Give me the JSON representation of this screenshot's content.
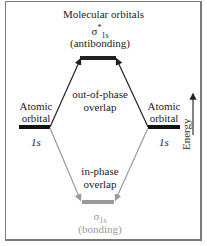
{
  "title": "Molecular orbitals",
  "antibonding": {
    "symbol": "σ",
    "superscript": "*",
    "subscript": "1s",
    "label": "(antibonding)"
  },
  "bonding": {
    "symbol": "σ",
    "subscript": "1s",
    "label": "(bonding)"
  },
  "left_atomic": {
    "line1": "Atomic",
    "line2": "orbital",
    "orbital": "1s"
  },
  "right_atomic": {
    "line1": "Atomic",
    "line2": "orbital",
    "orbital": "1s"
  },
  "out_of_phase": {
    "line1": "out-of-phase",
    "line2": "overlap"
  },
  "in_phase": {
    "line1": "in-phase",
    "line2": "overlap"
  },
  "axis": {
    "label": "Energy"
  },
  "colors": {
    "dark": "#222222",
    "gray": "#9a9a9a",
    "border": "#7a7a7a"
  }
}
